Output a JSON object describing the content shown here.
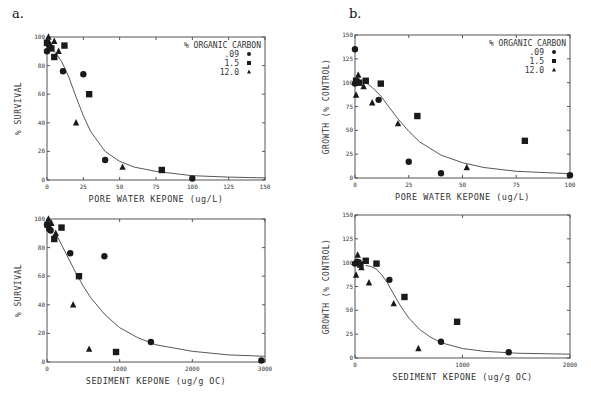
{
  "figure": {
    "panel_labels": [
      "a.",
      "b."
    ]
  },
  "chart_data": [
    {
      "id": "a-top",
      "type": "scatter",
      "title": "",
      "xlabel": "PORE WATER KEPONE (ug/L)",
      "ylabel": "% SURVIVAL",
      "xlim": [
        0,
        150
      ],
      "ylim": [
        0,
        100
      ],
      "xticks": [
        0,
        25,
        50,
        75,
        100,
        125,
        150
      ],
      "yticks": [
        0,
        20,
        40,
        60,
        80,
        100
      ],
      "grid": false,
      "legend": {
        "title": "% ORGANIC CARBON",
        "position": "upper right",
        "entries": [
          ".09",
          "1.5",
          "12.0"
        ]
      },
      "series": [
        {
          "name": ".09",
          "marker": "circle",
          "points": [
            [
              0,
              90
            ],
            [
              1,
              95
            ],
            [
              2,
              93
            ],
            [
              11,
              76
            ],
            [
              25,
              74
            ],
            [
              40,
              14
            ],
            [
              100,
              1
            ]
          ]
        },
        {
          "name": "1.5",
          "marker": "square",
          "points": [
            [
              0,
              96
            ],
            [
              3,
              92
            ],
            [
              5,
              86
            ],
            [
              12,
              94
            ],
            [
              29,
              60
            ],
            [
              79,
              7
            ]
          ]
        },
        {
          "name": "12.0",
          "marker": "triangle",
          "points": [
            [
              1,
              100
            ],
            [
              5,
              97
            ],
            [
              8,
              90
            ],
            [
              20,
              40
            ],
            [
              52,
              9
            ]
          ]
        }
      ],
      "fit_curve": [
        [
          0,
          94
        ],
        [
          5,
          90
        ],
        [
          10,
          83
        ],
        [
          15,
          72
        ],
        [
          20,
          58
        ],
        [
          25,
          45
        ],
        [
          30,
          34
        ],
        [
          40,
          20
        ],
        [
          50,
          13
        ],
        [
          60,
          9
        ],
        [
          75,
          6
        ],
        [
          100,
          3
        ],
        [
          125,
          2
        ],
        [
          150,
          1.5
        ]
      ]
    },
    {
      "id": "b-top",
      "type": "scatter",
      "title": "",
      "xlabel": "PORE WATER KEPONE (ug/L)",
      "ylabel": "GROWTH (% CONTROL)",
      "xlim": [
        0,
        100
      ],
      "ylim": [
        0,
        150
      ],
      "xticks": [
        0,
        25,
        50,
        75,
        100
      ],
      "yticks": [
        0,
        25,
        50,
        75,
        100,
        125,
        150
      ],
      "grid": false,
      "legend": {
        "title": "% ORGANIC CARBON",
        "position": "upper right",
        "entries": [
          ".09",
          "1.5",
          "12.0"
        ]
      },
      "series": [
        {
          "name": ".09",
          "marker": "circle",
          "points": [
            [
              0,
              135
            ],
            [
              0,
              99
            ],
            [
              1,
              101
            ],
            [
              11,
              82
            ],
            [
              25,
              17
            ],
            [
              40,
              5
            ],
            [
              100,
              3
            ]
          ]
        },
        {
          "name": "1.5",
          "marker": "square",
          "points": [
            [
              0.5,
              102
            ],
            [
              2,
              100
            ],
            [
              5,
              102
            ],
            [
              12,
              99
            ],
            [
              29,
              65
            ],
            [
              79,
              39
            ]
          ]
        },
        {
          "name": "12.0",
          "marker": "triangle",
          "points": [
            [
              0.5,
              87
            ],
            [
              1.5,
              108
            ],
            [
              4,
              96
            ],
            [
              8,
              79
            ],
            [
              20,
              57
            ],
            [
              52,
              11
            ]
          ]
        }
      ],
      "fit_curve": [
        [
          5,
          100
        ],
        [
          8,
          95
        ],
        [
          12,
          86
        ],
        [
          16,
          74
        ],
        [
          20,
          62
        ],
        [
          25,
          49
        ],
        [
          30,
          38
        ],
        [
          40,
          24
        ],
        [
          50,
          16
        ],
        [
          60,
          11
        ],
        [
          75,
          7
        ],
        [
          100,
          4.5
        ]
      ]
    },
    {
      "id": "a-bottom",
      "type": "scatter",
      "title": "",
      "xlabel": "SEDIMENT KEPONE (ug/g OC)",
      "ylabel": "% SURVIVAL",
      "xlim": [
        0,
        3000
      ],
      "ylim": [
        0,
        100
      ],
      "xticks": [
        0,
        1000,
        2000,
        3000
      ],
      "yticks": [
        0,
        20,
        40,
        60,
        80,
        100
      ],
      "grid": false,
      "series": [
        {
          "name": ".09",
          "marker": "circle",
          "points": [
            [
              0,
              96
            ],
            [
              30,
              93
            ],
            [
              50,
              92
            ],
            [
              320,
              76
            ],
            [
              790,
              74
            ],
            [
              1430,
              14
            ],
            [
              2950,
              1
            ]
          ]
        },
        {
          "name": "1.5",
          "marker": "square",
          "points": [
            [
              10,
              96
            ],
            [
              100,
              86
            ],
            [
              200,
              94
            ],
            [
              440,
              60
            ],
            [
              950,
              7
            ]
          ]
        },
        {
          "name": "12.0",
          "marker": "triangle",
          "points": [
            [
              20,
              100
            ],
            [
              60,
              97
            ],
            [
              120,
              90
            ],
            [
              360,
              40
            ],
            [
              580,
              9
            ]
          ]
        }
      ],
      "fit_curve": [
        [
          120,
          90
        ],
        [
          200,
          82
        ],
        [
          300,
          72
        ],
        [
          400,
          62
        ],
        [
          500,
          53
        ],
        [
          600,
          45
        ],
        [
          800,
          33
        ],
        [
          1000,
          24
        ],
        [
          1250,
          17
        ],
        [
          1500,
          12
        ],
        [
          2000,
          7.5
        ],
        [
          2500,
          5
        ],
        [
          3000,
          4
        ]
      ]
    },
    {
      "id": "b-bottom",
      "type": "scatter",
      "title": "",
      "xlabel": "SEDIMENT KEPONE (ug/g OC)",
      "ylabel": "GROWTH (% CONTROL)",
      "xlim": [
        0,
        2000
      ],
      "ylim": [
        0,
        150
      ],
      "xticks": [
        0,
        1000,
        2000
      ],
      "yticks": [
        0,
        25,
        50,
        75,
        100,
        125,
        150
      ],
      "grid": false,
      "series": [
        {
          "name": ".09",
          "marker": "circle",
          "points": [
            [
              0,
              99
            ],
            [
              20,
              101
            ],
            [
              320,
              82
            ],
            [
              800,
              17
            ],
            [
              1430,
              6
            ]
          ]
        },
        {
          "name": "1.5",
          "marker": "square",
          "points": [
            [
              30,
              100
            ],
            [
              50,
              98
            ],
            [
              100,
              102
            ],
            [
              200,
              99
            ],
            [
              460,
              64
            ],
            [
              950,
              38
            ]
          ]
        },
        {
          "name": "12.0",
          "marker": "triangle",
          "points": [
            [
              10,
              87
            ],
            [
              25,
              108
            ],
            [
              60,
              95
            ],
            [
              130,
              79
            ],
            [
              360,
              57
            ],
            [
              590,
              10
            ]
          ]
        }
      ],
      "fit_curve": [
        [
          100,
          97
        ],
        [
          150,
          96
        ],
        [
          200,
          93
        ],
        [
          250,
          87
        ],
        [
          300,
          79
        ],
        [
          350,
          69
        ],
        [
          400,
          59
        ],
        [
          450,
          50
        ],
        [
          500,
          42
        ],
        [
          600,
          30
        ],
        [
          700,
          22
        ],
        [
          800,
          16
        ],
        [
          1000,
          10
        ],
        [
          1200,
          7
        ],
        [
          1500,
          5
        ],
        [
          2000,
          4
        ]
      ]
    }
  ],
  "layout": {
    "panels": [
      {
        "id": "a-top",
        "x0": 47,
        "x1": 265,
        "y0": 180,
        "y1": 37
      },
      {
        "id": "b-top",
        "x0": 355,
        "x1": 570,
        "y0": 178,
        "y1": 35
      },
      {
        "id": "a-bottom",
        "x0": 47,
        "x1": 265,
        "y0": 362,
        "y1": 219
      },
      {
        "id": "b-bottom",
        "x0": 355,
        "x1": 570,
        "y0": 358,
        "y1": 215
      }
    ]
  }
}
